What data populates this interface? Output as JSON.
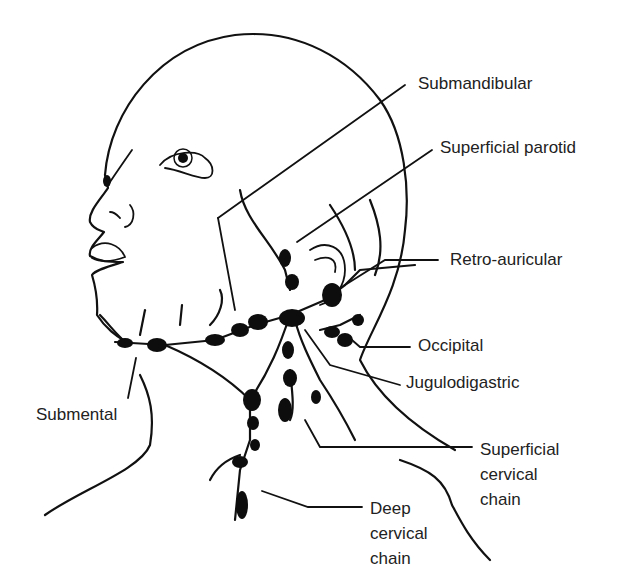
{
  "figure": {
    "labels": {
      "submandibular": "Submandibular",
      "superficial_parotid": "Superficial parotid",
      "retro_auricular": "Retro-auricular",
      "occipital": "Occipital",
      "jugulodigastric": "Jugulodigastric",
      "submental": "Submental",
      "superficial_cervical": "Superficial\ncervical\nchain",
      "deep_cervical": "Deep\ncervical\nchain"
    },
    "colors": {
      "ink": "#111111",
      "label": "#222222",
      "background": "#ffffff"
    }
  }
}
